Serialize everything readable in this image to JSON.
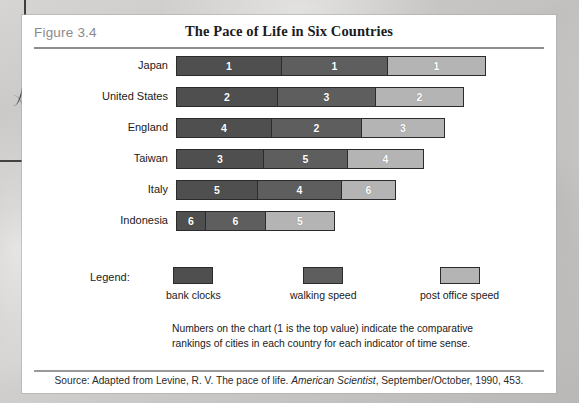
{
  "figure": {
    "number_label": "Figure 3.4",
    "title": "The Pace of Life in Six Countries",
    "legend_label": "Legend:",
    "note": "Numbers on the chart (1 is the top value) indicate the comparative rankings of cities in each country for each indicator of time sense.",
    "source_prefix": "Source: Adapted from Levine, R. V. The pace of life. ",
    "source_italic": "American Scientist",
    "source_suffix": ", September/October, 1990, 453."
  },
  "colors": {
    "segment_bank_clocks": "#4f4f4f",
    "segment_walking_speed": "#5e5e5e",
    "segment_post_office_speed": "#b4b4b4",
    "bar_outline": "#2b2b2b",
    "rule": "#8d8d8d",
    "figure_number_text": "#8a8a8a",
    "card_background": "#ffffff"
  },
  "chart_data": {
    "type": "bar",
    "subtype": "stacked-horizontal",
    "title": "The Pace of Life in Six Countries",
    "xlabel": "",
    "ylabel": "",
    "grid": false,
    "legend_position": "bottom",
    "note": "Numbers on the chart (1 is the top value) indicate the comparative rankings of cities in each country for each indicator of time sense.",
    "series": [
      {
        "name": "bank clocks",
        "color": "#4f4f4f",
        "values": [
          1,
          2,
          4,
          3,
          5,
          6
        ],
        "widths_px": [
          104,
          100,
          94,
          86,
          80,
          28
        ]
      },
      {
        "name": "walking speed",
        "color": "#5e5e5e",
        "values": [
          1,
          3,
          2,
          5,
          4,
          6
        ],
        "widths_px": [
          106,
          98,
          90,
          84,
          84,
          60
        ]
      },
      {
        "name": "post office speed",
        "color": "#b4b4b4",
        "values": [
          1,
          2,
          3,
          4,
          6,
          5
        ],
        "widths_px": [
          98,
          88,
          83,
          76,
          54,
          69
        ]
      }
    ],
    "categories": [
      "Japan",
      "United States",
      "England",
      "Taiwan",
      "Italy",
      "Indonesia"
    ]
  },
  "rows": [
    {
      "country": "Japan",
      "segments": [
        {
          "series": "bank clocks",
          "rank": "1",
          "width": 104
        },
        {
          "series": "walking speed",
          "rank": "1",
          "width": 106
        },
        {
          "series": "post office speed",
          "rank": "1",
          "width": 98
        }
      ]
    },
    {
      "country": "United States",
      "segments": [
        {
          "series": "bank clocks",
          "rank": "2",
          "width": 100
        },
        {
          "series": "walking speed",
          "rank": "3",
          "width": 98
        },
        {
          "series": "post office speed",
          "rank": "2",
          "width": 88
        }
      ]
    },
    {
      "country": "England",
      "segments": [
        {
          "series": "bank clocks",
          "rank": "4",
          "width": 94
        },
        {
          "series": "walking speed",
          "rank": "2",
          "width": 90
        },
        {
          "series": "post office speed",
          "rank": "3",
          "width": 83
        }
      ]
    },
    {
      "country": "Taiwan",
      "segments": [
        {
          "series": "bank clocks",
          "rank": "3",
          "width": 86
        },
        {
          "series": "walking speed",
          "rank": "5",
          "width": 84
        },
        {
          "series": "post office speed",
          "rank": "4",
          "width": 76
        }
      ]
    },
    {
      "country": "Italy",
      "segments": [
        {
          "series": "bank clocks",
          "rank": "5",
          "width": 80
        },
        {
          "series": "walking speed",
          "rank": "4",
          "width": 84
        },
        {
          "series": "post office speed",
          "rank": "6",
          "width": 54
        }
      ]
    },
    {
      "country": "Indonesia",
      "segments": [
        {
          "series": "bank clocks",
          "rank": "6",
          "width": 28
        },
        {
          "series": "walking speed",
          "rank": "6",
          "width": 60
        },
        {
          "series": "post office speed",
          "rank": "5",
          "width": 69
        }
      ]
    }
  ],
  "legend": [
    {
      "label": "bank clocks",
      "color": "#4f4f4f",
      "left": 144
    },
    {
      "label": "walking speed",
      "color": "#5e5e5e",
      "left": 268
    },
    {
      "label": "post office speed",
      "color": "#b4b4b4",
      "left": 398
    }
  ]
}
